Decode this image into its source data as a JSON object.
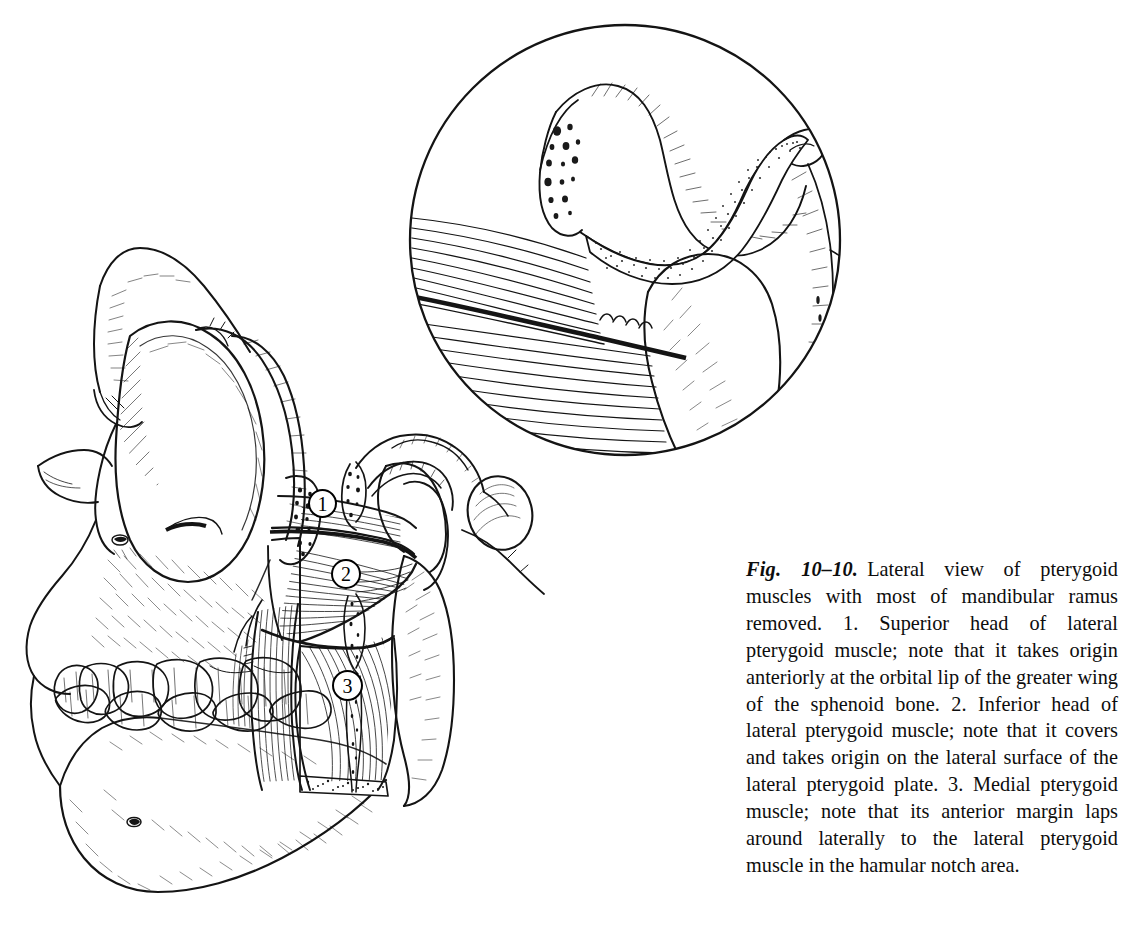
{
  "figure": {
    "label": "Fig. 10–10.",
    "caption": "Lateral view of pterygoid muscles with most of mandibular ramus removed. 1. Superior head of lateral pterygoid muscle; note that it takes origin anteriorly at the orbital lip of the greater wing of the sphenoid bone. 2. Inferior head of lateral pterygoid muscle; note that it covers and takes origin on the lateral surface of the lateral pterygoid plate. 3. Medial pterygoid muscle; note that its anterior margin laps around laterally to the lateral pterygoid muscle in the hamular notch area.",
    "background_color": "#ffffff",
    "ink_color": "#111111"
  },
  "callouts": [
    {
      "number": "1",
      "refers_to": "Superior head of lateral pterygoid muscle"
    },
    {
      "number": "2",
      "refers_to": "Inferior head of lateral pterygoid muscle"
    },
    {
      "number": "3",
      "refers_to": "Medial pterygoid muscle"
    }
  ],
  "illustration": {
    "main_view": "Lateral view of skull with mandibular ramus removed showing pterygoid muscles",
    "inset": "Magnified detail of temporomandibular joint with articular disc and lateral pterygoid insertion"
  }
}
